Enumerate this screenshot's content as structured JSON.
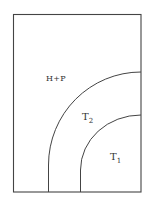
{
  "diagram": {
    "frame": {
      "x": 13,
      "y": 14,
      "width": 128,
      "height": 178,
      "stroke": "#444444"
    },
    "regions": [
      {
        "id": "hp",
        "label": "H+P"
      },
      {
        "id": "t2",
        "label_main": "T",
        "label_sub": "2"
      },
      {
        "id": "t1",
        "label_main": "T",
        "label_sub": "1"
      }
    ],
    "boundaries": [
      {
        "id": "outer",
        "vertical_x": 48,
        "meets_right_y": 72,
        "arc_end_y": 165
      },
      {
        "id": "inner",
        "vertical_x": 80,
        "meets_right_y": 115,
        "arc_end_y": 170
      }
    ],
    "line_color": "#444444"
  }
}
